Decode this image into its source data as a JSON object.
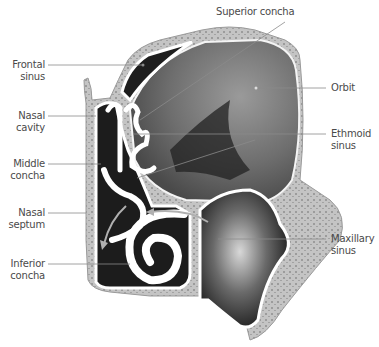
{
  "diagram": {
    "colors": {
      "background": "#ffffff",
      "bone": "#c8c8c8",
      "mucosa": "#ffffff",
      "cavity_dark": "#1e1e1e",
      "orbit": "#7a7a7a",
      "leader_line": "#8a8a8a",
      "label_text": "#4a4a4a",
      "arrow": "#b0b0b0"
    },
    "labels": {
      "superior_concha": {
        "line1": "Superior concha"
      },
      "frontal_sinus": {
        "line1": "Frontal",
        "line2": "sinus"
      },
      "orbit": {
        "line1": "Orbit"
      },
      "nasal_cavity": {
        "line1": "Nasal",
        "line2": "cavity"
      },
      "ethmoid_sinus": {
        "line1": "Ethmoid",
        "line2": "sinus"
      },
      "middle_concha": {
        "line1": "Middle",
        "line2": "concha"
      },
      "nasal_septum": {
        "line1": "Nasal",
        "line2": "septum"
      },
      "maxillary_sinus": {
        "line1": "Maxillary",
        "line2": "sinus"
      },
      "inferior_concha": {
        "line1": "Inferior",
        "line2": "concha"
      }
    }
  }
}
